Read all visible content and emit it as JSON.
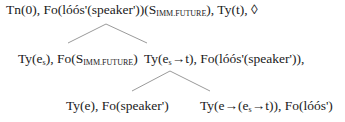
{
  "tree": {
    "root": {
      "parts": [
        "Tn(0), Fo(lóós'(speaker'))(S",
        "IMM.FUTURE",
        "), Ty(t), ◊"
      ]
    },
    "level1_left": {
      "parts": [
        "Ty(e",
        "s",
        "), Fo(S",
        "IMM.FUTURE",
        ")"
      ]
    },
    "level1_right": {
      "parts": [
        "Ty(e",
        "s",
        "→t), Fo(lóós'(speaker')),"
      ]
    },
    "level2_left": {
      "text": "Ty(e), Fo(speaker')"
    },
    "level2_right": {
      "parts": [
        "Ty(e→(e",
        "s",
        "→t)), Fo(lóós')"
      ]
    },
    "edge_color": "#9a9a9a"
  }
}
